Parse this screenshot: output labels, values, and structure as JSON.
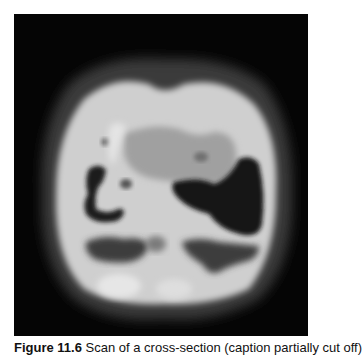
{
  "figure": {
    "image_description": "Grayscale cross-sectional scan image on black background",
    "colors": {
      "background": "#050505",
      "halo": "#3a3a3a",
      "tissue_bright": "#d8d8d8",
      "tissue_mid": "#a8a8a8",
      "dark_cavity": "#1a1a1a",
      "gray_region": "#4a4a4a"
    }
  },
  "caption": {
    "label": "Figure 11.6",
    "text": " Scan of a cross-section (caption partially cut off)"
  }
}
